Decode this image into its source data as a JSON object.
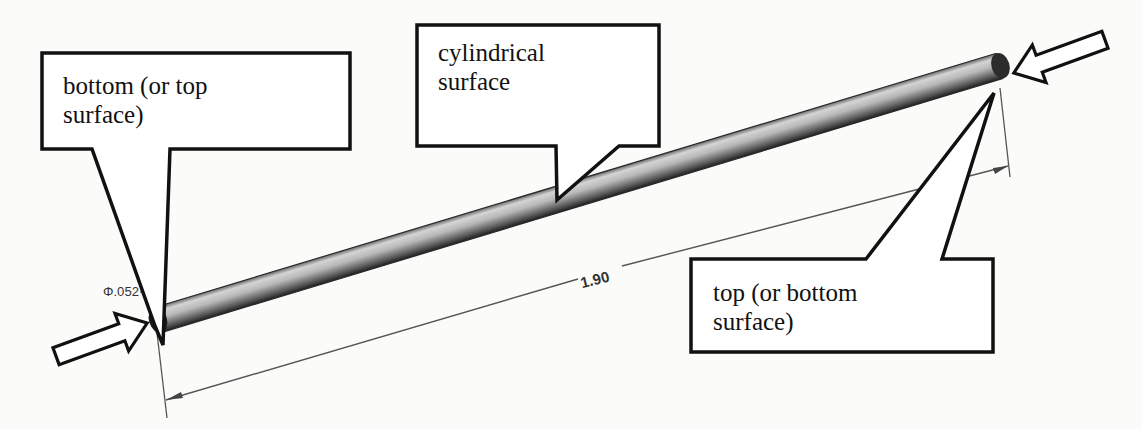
{
  "diagram": {
    "colors": {
      "background": "#fbfbfa",
      "outline": "#111111",
      "rod_light": "#c9c9c9",
      "rod_dark": "#3a3a3a",
      "dimension_line": "#555555"
    },
    "callouts": [
      {
        "id": "bottom",
        "text": "bottom (or top\nsurface)"
      },
      {
        "id": "cylindrical",
        "text": "cylindrical\nsurface"
      },
      {
        "id": "top",
        "text": "top (or bottom\nsurface)"
      }
    ],
    "dimensions": {
      "diameter_label": "Φ.052",
      "length_label": "1.90"
    },
    "arrows": [
      {
        "id": "left-arrow",
        "points_to": "bottom end face"
      },
      {
        "id": "right-arrow",
        "points_to": "top end face"
      }
    ]
  }
}
